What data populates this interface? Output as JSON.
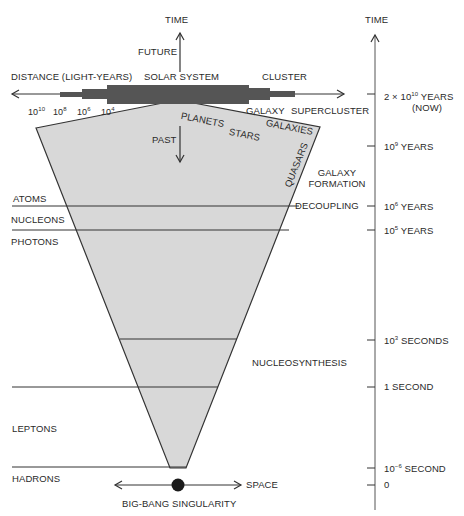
{
  "diagram": {
    "colors": {
      "cone_fill": "#d8d8d8",
      "line": "#333333",
      "bar": "#555555"
    },
    "top": {
      "time_label": "TIME",
      "future_label": "FUTURE",
      "past_label": "PAST",
      "distance_label": "DISTANCE (LIGHT-YEARS)",
      "scale_ticks": [
        {
          "base": "10",
          "exp": "10"
        },
        {
          "base": "10",
          "exp": "8"
        },
        {
          "base": "10",
          "exp": "6"
        },
        {
          "base": "10",
          "exp": "4"
        }
      ],
      "structures_above": [
        "SOLAR SYSTEM",
        "CLUSTER"
      ],
      "structures_below": [
        "GALAXY",
        "SUPERCLUSTER"
      ]
    },
    "cone_labels": {
      "planets": "PLANETS",
      "stars": "STARS",
      "galaxies": "GALAXIES",
      "quasars": "QUASARS"
    },
    "epochs_left": {
      "atoms": "ATOMS",
      "nucleons": "NUCLEONS",
      "photons": "PHOTONS",
      "leptons": "LEPTONS",
      "hadrons": "HADRONS"
    },
    "events_right": {
      "galaxy_formation_1": "GALAXY",
      "galaxy_formation_2": "FORMATION",
      "decoupling": "DECOUPLING",
      "nucleosynthesis": "NUCLEOSYNTHESIS"
    },
    "time_axis": {
      "label": "TIME",
      "ticks": [
        {
          "pre": "2 × 10",
          "exp": "10",
          "post": " YEARS",
          "line2": "(NOW)"
        },
        {
          "pre": "10",
          "exp": "9",
          "post": " YEARS"
        },
        {
          "pre": "10",
          "exp": "6",
          "post": " YEARS"
        },
        {
          "pre": "10",
          "exp": "5",
          "post": " YEARS"
        },
        {
          "pre": "10",
          "exp": "3",
          "post": " SECONDS"
        },
        {
          "pre": "",
          "exp": "",
          "post": "1 SECOND"
        },
        {
          "pre": "10",
          "exp": "−6",
          "post": " SECOND"
        },
        {
          "pre": "",
          "exp": "",
          "post": "0"
        }
      ]
    },
    "bottom": {
      "space_label": "SPACE",
      "singularity_label": "BIG-BANG SINGULARITY"
    }
  }
}
